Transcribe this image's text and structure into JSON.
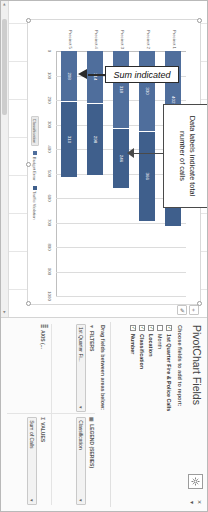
{
  "window": {
    "pane_title": "PivotChart Fields",
    "gear_icon": "gear-icon",
    "close_label": "×",
    "dropdown_label": "▾"
  },
  "fields_pane": {
    "choose_label": "Choose fields to add to report:",
    "fields": [
      {
        "name": "1st Quarter Fire & Police Calls",
        "checked": true,
        "bold": true
      },
      {
        "name": "Month",
        "checked": false,
        "bold": false
      },
      {
        "name": "Location",
        "checked": true,
        "bold": true
      },
      {
        "name": "Classification",
        "checked": true,
        "bold": true
      },
      {
        "name": "Number",
        "checked": true,
        "bold": true
      }
    ],
    "drag_label": "Drag fields between areas below:",
    "areas": [
      {
        "key": "filters",
        "icon": "filter-icon",
        "title": "FILTERS",
        "pill": "1st Quarter Fi...",
        "caret": "▾"
      },
      {
        "key": "legend",
        "icon": "legend-icon",
        "title": "LEGEND (SERIES)",
        "pill": "Classification",
        "caret": "▾"
      },
      {
        "key": "axis",
        "icon": "axis-icon",
        "title": "AXIS (...",
        "pill": "",
        "caret": ""
      },
      {
        "key": "values",
        "icon": "sigma-icon",
        "title": "VALUES",
        "pill": "Sum of Calls",
        "caret": "▾"
      }
    ]
  },
  "annotations": {
    "data_labels_note": "Data labels indicate total number of calls",
    "sum_note": "Sum indicated"
  },
  "chart_buttons": [
    {
      "name": "chart-elements-button",
      "glyph": "+"
    },
    {
      "name": "chart-styles-button",
      "glyph": "✐"
    }
  ],
  "scrollbar": {
    "left_arrow": "◂",
    "right_arrow": "▸"
  },
  "chart_data": {
    "type": "bar",
    "orientation": "horizontal",
    "stacked": true,
    "title": "1st Quarter Calls",
    "xlabel": "",
    "ylabel": "",
    "xlim": [
      0,
      1000
    ],
    "xticks": [
      "0",
      "100",
      "200",
      "300",
      "400",
      "500",
      "600",
      "700",
      "800",
      "900",
      "1000"
    ],
    "grid": true,
    "legend_position": "bottom",
    "legend_title": "Classification",
    "categories": [
      "Precinct 1",
      "Precinct 2",
      "Precinct 3",
      "Precinct 4",
      "Precinct 5"
    ],
    "series": [
      {
        "name": "Budget Error",
        "color": "#4f6e9c",
        "values": [
          402,
          330,
          318,
          214,
          208
        ]
      },
      {
        "name": "Traffic Violation",
        "color": "#3f5f8c",
        "values": [
          318,
          366,
          246,
          298,
          310
        ]
      }
    ],
    "totals": [
      "720",
      "696",
      "564",
      "512",
      "518"
    ]
  }
}
